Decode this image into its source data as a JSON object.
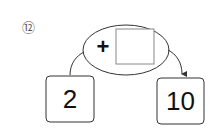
{
  "problem": {
    "number_label": "⑫",
    "operator": "+",
    "answer_box_value": "",
    "start_value": "2",
    "result_value": "10"
  },
  "colors": {
    "stroke": "#333333",
    "answer_box_stroke": "#888888",
    "text": "#111111"
  }
}
